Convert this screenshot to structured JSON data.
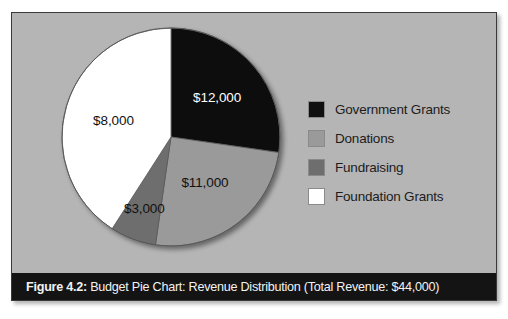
{
  "figure": {
    "caption_prefix": "Figure 4.2:",
    "caption_rest": " Budget Pie Chart: Revenue Distribution (Total Revenue: $44,000)",
    "background_color": "#b5b5b5",
    "caption_bar_color": "#141414",
    "caption_text_color": "#f2f2f2"
  },
  "legend": {
    "items": [
      {
        "label": "Government Grants",
        "color": "#101010"
      },
      {
        "label": "Donations",
        "color": "#9a9a9a"
      },
      {
        "label": "Fundraising",
        "color": "#6e6e6e"
      },
      {
        "label": "Foundation Grants",
        "color": "#ffffff"
      }
    ]
  },
  "chart_data": {
    "type": "pie",
    "title": "Budget Pie Chart: Revenue Distribution",
    "subtitle": "Total Revenue: $44,000",
    "figure_number": "Figure 4.2",
    "total": 44000,
    "total_label": "$44,000",
    "currency": "USD",
    "start_angle_deg": 0,
    "direction": "clockwise",
    "legend_position": "right",
    "grid": false,
    "categories": [
      "Government Grants",
      "Donations",
      "Fundraising",
      "Foundation Grants"
    ],
    "values": [
      12000,
      11000,
      3000,
      8000
    ],
    "labels": [
      "$12,000",
      "$11,000",
      "$3,000",
      "$8,000"
    ],
    "colors": [
      "#101010",
      "#9a9a9a",
      "#6e6e6e",
      "#ffffff"
    ],
    "slices": [
      {
        "name": "Government Grants",
        "value": 12000,
        "label": "$12,000",
        "percent": 27.3,
        "color": "#101010",
        "label_text_color": "#ffffff",
        "start_deg": 0.0,
        "end_deg": 98.2
      },
      {
        "name": "Donations",
        "value": 11000,
        "label": "$11,000",
        "percent": 25.0,
        "color": "#9a9a9a",
        "label_text_color": "#111111",
        "start_deg": 98.2,
        "end_deg": 188.2
      },
      {
        "name": "Fundraising",
        "value": 3000,
        "label": "$3,000",
        "percent": 6.8,
        "color": "#6e6e6e",
        "label_text_color": "#111111",
        "start_deg": 188.2,
        "end_deg": 212.7
      },
      {
        "name": "Foundation Grants",
        "value": 8000,
        "label": "$8,000",
        "percent": 18.2,
        "color": "#ffffff",
        "label_text_color": "#111111",
        "start_deg": 212.7,
        "end_deg": 360.0
      }
    ]
  }
}
